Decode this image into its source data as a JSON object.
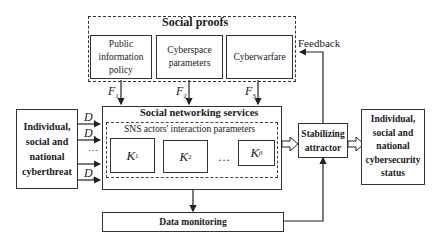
{
  "social_proofs": {
    "title": "Social proofs",
    "items": [
      {
        "label": "Public information policy",
        "lines": [
          "Public",
          "information",
          "policy"
        ],
        "flow": "F",
        "sub": "1"
      },
      {
        "label": "Cyberspace parameters",
        "lines": [
          "Cyberspace",
          "parameters"
        ],
        "flow": "F",
        "sub": "2"
      },
      {
        "label": "Cyberwarfare",
        "lines": [
          "Cyberwarfare"
        ],
        "flow": "F",
        "sub": "3"
      }
    ]
  },
  "feedback_label": "Feedback",
  "threat": {
    "lines": [
      "Individual,",
      "social and",
      "national",
      "cyberthreat"
    ],
    "inputs": [
      {
        "var": "D",
        "sub": "1"
      },
      {
        "var": "D",
        "sub": "2"
      },
      {
        "var": "…",
        "sub": ""
      },
      {
        "var": "D",
        "sub": "α"
      }
    ]
  },
  "sns": {
    "title": "Social networking services",
    "inner_title": "SNS actors' interaction parameters",
    "params": [
      {
        "var": "K",
        "sub": "1"
      },
      {
        "var": "K",
        "sub": "2"
      },
      {
        "var": "…",
        "sub": ""
      },
      {
        "var": "K",
        "sub": "β"
      }
    ]
  },
  "attractor": {
    "lines": [
      "Stabilizing",
      "attractor"
    ]
  },
  "status": {
    "lines": [
      "Individual,",
      "social and",
      "national",
      "cybersecurity",
      "status"
    ]
  },
  "monitoring": {
    "label": "Data monitoring"
  }
}
